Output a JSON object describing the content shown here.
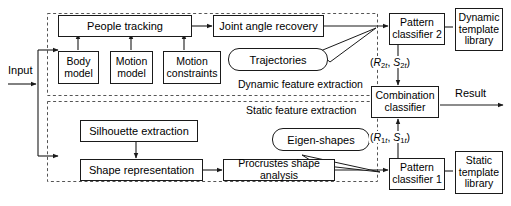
{
  "diagram": {
    "colors": {
      "stroke": "#1a1a1a",
      "background": "#ffffff",
      "text": "#000000",
      "dashed_region": "#555555"
    },
    "input": {
      "label": "Input"
    },
    "output": {
      "label": "Result"
    },
    "regions": [
      {
        "id": "dynamic",
        "label": "Dynamic feature extraction"
      },
      {
        "id": "static",
        "label": "Static feature extraction"
      }
    ],
    "nodes": [
      {
        "id": "people-tracking",
        "label": "People tracking"
      },
      {
        "id": "body-model",
        "label": "Body\nmodel"
      },
      {
        "id": "motion-model",
        "label": "Motion\nmodel"
      },
      {
        "id": "motion-constraints",
        "label": "Motion\nconstraints"
      },
      {
        "id": "joint-angle-recovery",
        "label": "Joint angle recovery"
      },
      {
        "id": "pattern-classifier-2",
        "label": "Pattern\nclassifier 2"
      },
      {
        "id": "dynamic-template-library",
        "label": "Dynamic\ntemplate\nlibrary"
      },
      {
        "id": "combination-classifier",
        "label": "Combination\nclassifier"
      },
      {
        "id": "silhouette-extraction",
        "label": "Silhouette extraction"
      },
      {
        "id": "shape-representation",
        "label": "Shape representation"
      },
      {
        "id": "procrustes-shape-analysis",
        "label": "Procrustes shape analysis"
      },
      {
        "id": "pattern-classifier-1",
        "label": "Pattern\nclassifier 1"
      },
      {
        "id": "static-template-library",
        "label": "Static\ntemplate\nlibrary"
      }
    ],
    "callouts": [
      {
        "id": "trajectories",
        "label": "Trajectories"
      },
      {
        "id": "eigen-shapes",
        "label": "Eigen-shapes"
      }
    ],
    "signals": [
      {
        "id": "dynamic-signature",
        "base": "R",
        "index": "2",
        "frame": "t",
        "base2": "S",
        "index2": "2",
        "frame2": "t",
        "text": "(R2t, S2t)"
      },
      {
        "id": "static-signature",
        "base": "R",
        "index": "1",
        "frame": "t",
        "base2": "S",
        "index2": "1",
        "frame2": "t",
        "text": "(R1t, S1t)"
      }
    ]
  }
}
